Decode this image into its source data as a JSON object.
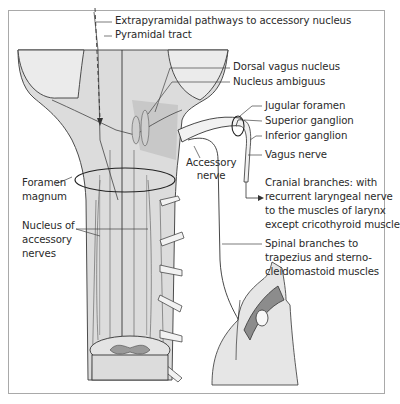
{
  "figure": {
    "labels": {
      "extrapyramidal": "Extrapyramidal pathways to accessory nucleus",
      "pyramidal": "Pyramidal tract",
      "dorsal_vagus": "Dorsal vagus nucleus",
      "nucleus_ambiguus": "Nucleus ambiguus",
      "jugular_foramen": "Jugular foramen",
      "superior_ganglion": "Superior ganglion",
      "inferior_ganglion": "Inferior ganglion",
      "vagus_nerve": "Vagus nerve",
      "accessory_nerve_1": "Accessory",
      "accessory_nerve_2": "nerve",
      "foramen_magnum_1": "Foramen",
      "foramen_magnum_2": "magnum",
      "nucleus_accessory_1": "Nucleus of",
      "nucleus_accessory_2": "accessory",
      "nucleus_accessory_3": "nerves",
      "cranial_1": "Cranial branches: with",
      "cranial_2": "recurrent laryngeal nerve",
      "cranial_3": "to the muscles of larynx",
      "cranial_4": "except cricothyroid muscle",
      "spinal_1": "Spinal branches to",
      "spinal_2": "trapezius and sterno-",
      "spinal_3": "cleidomastoid muscles"
    },
    "colors": {
      "brainstem_fill": "#dcdcdc",
      "brainstem_dark": "#c4c4c4",
      "line": "#333333",
      "muscle": "#8c8c8c",
      "border": "#a9a9a9"
    }
  }
}
